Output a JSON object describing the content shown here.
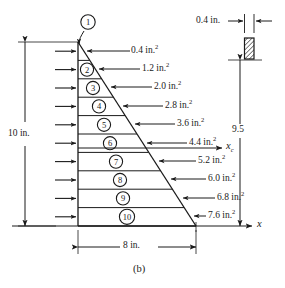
{
  "figure": {
    "caption": "(b)",
    "shape": "right triangle divided into ten horizontal strips",
    "height_label": "10 in.",
    "base_label": "8 in.",
    "strip_thickness_label": "0.4 in.",
    "centroid_distance_label": "9.5",
    "axis_x_label": "x",
    "axis_xc_label": "x",
    "axis_xc_subscript": "c"
  },
  "strips": [
    {
      "id": "1",
      "marker": "①",
      "area_label": "0.4 in.",
      "area_exp": "2",
      "area_value": 0.4
    },
    {
      "id": "2",
      "marker": "②",
      "area_label": "1.2 in.",
      "area_exp": "2",
      "area_value": 1.2
    },
    {
      "id": "3",
      "marker": "③",
      "area_label": "2.0 in.",
      "area_exp": "2",
      "area_value": 2.0
    },
    {
      "id": "4",
      "marker": "④",
      "area_label": "2.8 in.",
      "area_exp": "2",
      "area_value": 2.8
    },
    {
      "id": "5",
      "marker": "⑤",
      "area_label": "3.6 in.",
      "area_exp": "2",
      "area_value": 3.6
    },
    {
      "id": "6",
      "marker": "⑥",
      "area_label": "4.4 in.",
      "area_exp": "2",
      "area_value": 4.4
    },
    {
      "id": "7",
      "marker": "⑦",
      "area_label": "5.2 in.",
      "area_exp": "2",
      "area_value": 5.2
    },
    {
      "id": "8",
      "marker": "⑧",
      "area_label": "6.0 in.",
      "area_exp": "2",
      "area_value": 6.0
    },
    {
      "id": "9",
      "marker": "⑨",
      "area_label": "6.8 in.",
      "area_exp": "2",
      "area_value": 6.8
    },
    {
      "id": "10",
      "marker": "⑩",
      "area_label": "7.6 in.",
      "area_exp": "2",
      "area_value": 7.6
    }
  ],
  "detail": {
    "name": "strip-thickness-detail",
    "label": "0.4 in.",
    "hatched": true
  },
  "colors": {
    "line": "#1a1a1a",
    "background": "#ffffff",
    "hatch": "#1a1a1a"
  }
}
